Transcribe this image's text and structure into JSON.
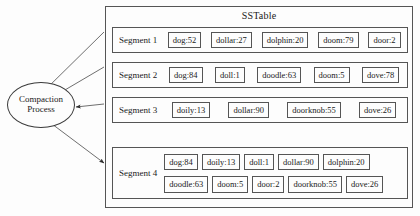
{
  "diagram": {
    "title": "SSTable",
    "process_node": {
      "line1": "Compaction",
      "line2": "Process"
    },
    "segments": [
      {
        "label": "Segment 1",
        "rows": [
          [
            "dog:52",
            "dollar:27",
            "dolphin:20",
            "doom:79",
            "door:2"
          ]
        ]
      },
      {
        "label": "Segment 2",
        "rows": [
          [
            "dog:84",
            "doll:1",
            "doodle:63",
            "doom:5",
            "dove:78"
          ]
        ]
      },
      {
        "label": "Segment 3",
        "rows": [
          [
            "doily:13",
            "dollar:90",
            "doorknob:55",
            "dove:26"
          ]
        ]
      },
      {
        "label": "Segment 4",
        "rows": [
          [
            "dog:84",
            "doily:13",
            "doll:1",
            "dollar:90",
            "dolphin:20"
          ],
          [
            "doodle:63",
            "doom:5",
            "door:2",
            "doorknob:55",
            "dove:26"
          ]
        ]
      }
    ],
    "edges": [
      {
        "from": "Segment 1",
        "to": "Compaction Process",
        "direction": "input"
      },
      {
        "from": "Segment 2",
        "to": "Compaction Process",
        "direction": "input"
      },
      {
        "from": "Segment 3",
        "to": "Compaction Process",
        "direction": "input"
      },
      {
        "from": "Compaction Process",
        "to": "Segment 4",
        "direction": "output"
      }
    ],
    "colors": {
      "stroke": "#555555",
      "text": "#1a1a1a",
      "background": "#fdfdfd"
    }
  }
}
